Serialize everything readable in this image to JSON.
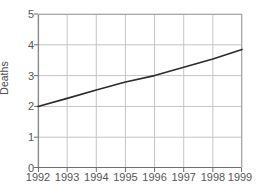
{
  "chart": {
    "title": "",
    "ylabel": "Deaths",
    "xlabel": ""
  },
  "chart_data": {
    "type": "line",
    "title": "",
    "xlabel": "",
    "ylabel": "Deaths",
    "x": [
      1992,
      1993,
      1994,
      1995,
      1996,
      1997,
      1998,
      1999
    ],
    "categories": [
      "1992",
      "1993",
      "1994",
      "1995",
      "1996",
      "1997",
      "1998",
      "1999"
    ],
    "series": [
      {
        "name": "Deaths",
        "values": [
          2.0,
          2.26,
          2.53,
          2.79,
          3.0,
          3.27,
          3.54,
          3.85
        ],
        "color": "#2b2b2b",
        "line_width": 1.6,
        "markers": false
      }
    ],
    "xlim": [
      1992,
      1999
    ],
    "ylim": [
      0,
      5
    ],
    "ytick_labels": [
      "0",
      "1",
      "2",
      "3",
      "4",
      "5"
    ],
    "yticks": [
      0,
      1,
      2,
      3,
      4,
      5
    ],
    "xtick_labels": [
      "1992",
      "1993",
      "1994",
      "1995",
      "1996",
      "1997",
      "1998",
      "1999"
    ],
    "grid": true,
    "grid_color": "#c4c4c4",
    "axis_color": "#8a8a8a",
    "legend": false,
    "legend_position": "none",
    "background": "#ffffff"
  }
}
